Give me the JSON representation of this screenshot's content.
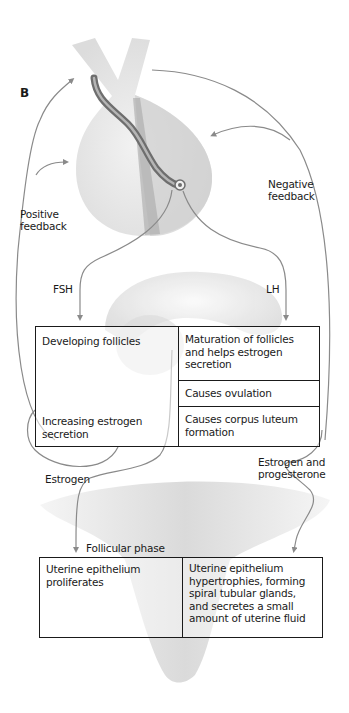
{
  "panel_label": "B",
  "colors": {
    "arrow": "#8a8a8a",
    "box_border": "#1a1a1a",
    "organ_fill": "#e6e6e6",
    "organ_shade": "#bdbdbd",
    "stalk_vessel": "#7a7a7a"
  },
  "labels": {
    "positive_feedback": "Positive feedback",
    "negative_feedback": "Negative feedback",
    "fsh": "FSH",
    "lh": "LH",
    "estrogen": "Estrogen",
    "estrogen_and_progesterone": "Estrogen and progesterone",
    "follicular_phase": "Follicular phase"
  },
  "ovary_table": {
    "left": {
      "top": "Developing follicles",
      "bottom": "Increasing estrogen secretion"
    },
    "right": [
      "Maturation of follicles and helps estrogen secretion",
      "Causes ovulation",
      "Causes corpus luteum formation"
    ]
  },
  "uterus_table": {
    "left": "Uterine epithelium proliferates",
    "right": "Uterine epithelium hypertrophies, forming spiral tubular glands, and secretes a small amount of uterine fluid"
  },
  "illustrations": [
    "pituitary-gland",
    "ovary",
    "uterus"
  ]
}
